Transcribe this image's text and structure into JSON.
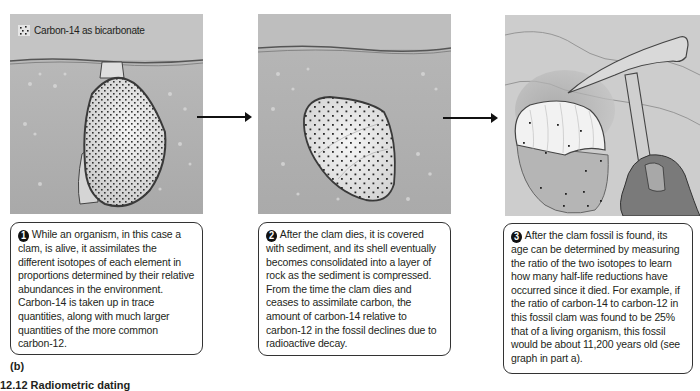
{
  "legend": {
    "icon": "dot-pattern-icon",
    "label": "Carbon-14 as bicarbonate"
  },
  "panels": [
    {
      "step": "1",
      "image": "living-clam-in-sediment",
      "text": "While an organism, in this case a clam, is alive, it assimilates the different isotopes of each element in proportions determined by their relative abundances in the environment. Carbon-14 is taken up in trace quantities, along with much larger quantities of the more common carbon-12."
    },
    {
      "step": "2",
      "image": "buried-clam-shell",
      "text": "After the clam dies, it is covered with sediment, and its shell eventually becomes consolidated into a layer of rock as the sediment is compressed. From the time the clam dies and ceases to assimilate carbon, the amount of carbon-14 relative to carbon-12 in the fossil declines due to radioactive decay."
    },
    {
      "step": "3",
      "image": "fossil-clam-and-rock-hammer",
      "text": "After the clam fossil is found, its age can be determined by measuring the ratio of the two isotopes to learn how many half-life reductions have occurred since it died. For example, if the ratio of carbon-14 to carbon-12 in this fossil clam was found to be 25% that of a living organism, this fossil would be about 11,200 years old (see graph in part a)."
    }
  ],
  "part_label": "(b)",
  "caption": "12.12  Radiometric dating"
}
